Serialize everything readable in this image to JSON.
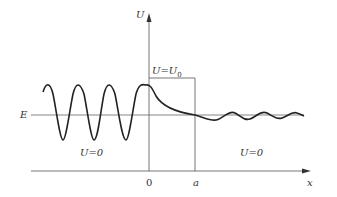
{
  "diagram": {
    "title": "",
    "axis_y_label": "U",
    "axis_x_label": "x",
    "energy_label": "E",
    "barrier_label_main": "U=U",
    "barrier_label_sub": "0",
    "region_left_label": "U=0",
    "region_right_label": "U=0",
    "tick_origin": "0",
    "tick_width": "a",
    "colors": {
      "line": "#555555",
      "wave": "#222222"
    }
  }
}
